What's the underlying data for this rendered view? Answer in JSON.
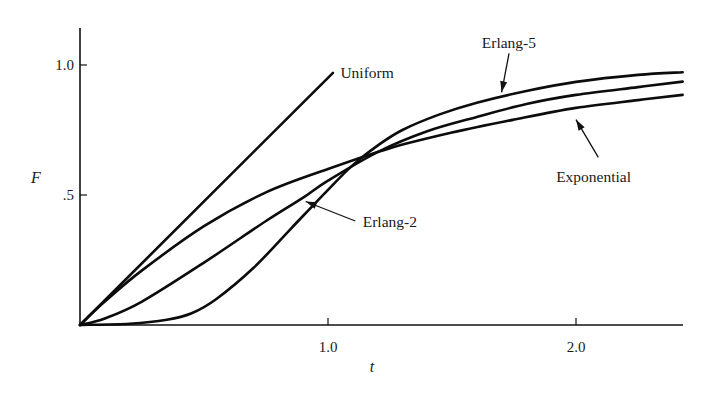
{
  "chart_data": {
    "type": "line",
    "title": "",
    "xlabel": "t",
    "ylabel": "F",
    "xlim": [
      0,
      2.43
    ],
    "ylim": [
      0,
      1.15
    ],
    "grid": false,
    "legend": "inline annotations with arrows",
    "x_ticks": [
      {
        "value": 1.0,
        "label": "1.0"
      },
      {
        "value": 2.0,
        "label": "2.0"
      }
    ],
    "y_ticks": [
      {
        "value": 0.5,
        "label": ".5"
      },
      {
        "value": 1.0,
        "label": "1.0"
      }
    ],
    "series": [
      {
        "name": "Uniform",
        "points": [
          [
            0,
            0
          ],
          [
            1.02,
            0.97
          ]
        ],
        "label_pos": [
          1.05,
          0.97
        ]
      },
      {
        "name": "Exponential",
        "points": [
          [
            0,
            0
          ],
          [
            0.1,
            0.09
          ],
          [
            0.25,
            0.21
          ],
          [
            0.5,
            0.38
          ],
          [
            0.75,
            0.51
          ],
          [
            1.0,
            0.6
          ],
          [
            1.25,
            0.68
          ],
          [
            1.5,
            0.74
          ],
          [
            1.75,
            0.79
          ],
          [
            2.0,
            0.835
          ],
          [
            2.25,
            0.865
          ],
          [
            2.43,
            0.885
          ]
        ],
        "arrow_from": [
          2.09,
          0.645
        ],
        "arrow_to": [
          2.0,
          0.79
        ],
        "label_pos": [
          1.92,
          0.57
        ]
      },
      {
        "name": "Erlang-2",
        "points": [
          [
            0,
            0
          ],
          [
            0.1,
            0.025
          ],
          [
            0.25,
            0.09
          ],
          [
            0.5,
            0.24
          ],
          [
            0.75,
            0.4
          ],
          [
            0.9,
            0.49
          ],
          [
            1.0,
            0.555
          ],
          [
            1.2,
            0.665
          ],
          [
            1.4,
            0.745
          ],
          [
            1.6,
            0.8
          ],
          [
            1.8,
            0.85
          ],
          [
            2.0,
            0.885
          ],
          [
            2.25,
            0.915
          ],
          [
            2.43,
            0.936
          ]
        ],
        "arrow_from": [
          1.11,
          0.4
        ],
        "arrow_to": [
          0.91,
          0.475
        ],
        "label_pos": [
          1.14,
          0.395
        ]
      },
      {
        "name": "Erlang-5",
        "points": [
          [
            0,
            0
          ],
          [
            0.2,
            0.005
          ],
          [
            0.35,
            0.02
          ],
          [
            0.45,
            0.045
          ],
          [
            0.55,
            0.1
          ],
          [
            0.7,
            0.22
          ],
          [
            0.85,
            0.37
          ],
          [
            1.0,
            0.52
          ],
          [
            1.1,
            0.615
          ],
          [
            1.2,
            0.69
          ],
          [
            1.3,
            0.75
          ],
          [
            1.45,
            0.81
          ],
          [
            1.6,
            0.855
          ],
          [
            1.8,
            0.9
          ],
          [
            2.0,
            0.935
          ],
          [
            2.25,
            0.962
          ],
          [
            2.43,
            0.972
          ]
        ],
        "arrow_from": [
          1.73,
          1.045
        ],
        "arrow_to": [
          1.7,
          0.895
        ],
        "label_pos": [
          1.62,
          1.085
        ]
      }
    ]
  },
  "axes": {
    "x_title": "t",
    "y_title": "F"
  }
}
